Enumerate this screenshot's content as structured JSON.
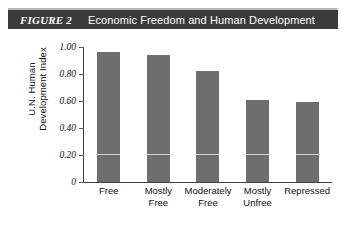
{
  "banner": {
    "figure_label": "FIGURE 2",
    "title": "Economic Freedom and Human Development",
    "background_color": "#3b3b3b",
    "text_color": "#ffffff"
  },
  "chart_data": {
    "type": "bar",
    "title": "Economic Freedom and Human Development",
    "categories": [
      "Free",
      "Mostly Free",
      "Moderately Free",
      "Mostly Unfree",
      "Repressed"
    ],
    "category_lines": [
      [
        "Free"
      ],
      [
        "Mostly",
        "Free"
      ],
      [
        "Moderately",
        "Free"
      ],
      [
        "Mostly",
        "Unfree"
      ],
      [
        "Repressed"
      ]
    ],
    "values": [
      0.96,
      0.94,
      0.82,
      0.61,
      0.59
    ],
    "xlabel": "",
    "ylabel": "U.N. Human Development Index",
    "ylabel_lines": [
      "U.N. Human",
      "Development Index"
    ],
    "ylim": [
      0,
      1.0
    ],
    "yticks": [
      1.0,
      0.8,
      0.6,
      0.4,
      0.2,
      0
    ],
    "ytick_labels": [
      "1.00",
      "0.80",
      "0.60",
      "0.40",
      "0.20",
      "0"
    ],
    "grid": false,
    "internal_gridline_value": 0.2,
    "legend": null,
    "bar_color": "#6e6e6e",
    "axis_color": "#3f3f3f",
    "gridline_color": "#d7d7d7"
  }
}
